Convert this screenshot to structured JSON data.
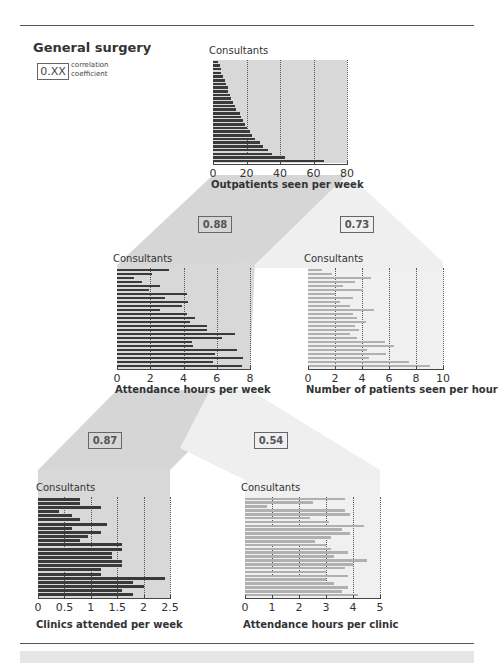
{
  "title": "General surgery",
  "legend": {
    "box_label": "0.XX",
    "text_line1": "correlation",
    "text_line2": "coefficient"
  },
  "colors": {
    "dark_bar": "#3a3a3a",
    "light_bar": "#b0b0b0",
    "dark_band": "#cfcfcf",
    "light_band": "#ececec",
    "plot_bg": "#d8d8d8",
    "plot_bg_light": "#f0f0f0"
  },
  "correlations": [
    {
      "id": "outpatients_vs_attendance",
      "value": "0.88"
    },
    {
      "id": "outpatients_vs_patients_per_hour",
      "value": "0.73"
    },
    {
      "id": "attendance_vs_clinics",
      "value": "0.87"
    },
    {
      "id": "attendance_vs_hours_per_clinic",
      "value": "0.54"
    }
  ],
  "chart_data": [
    {
      "type": "bar",
      "orientation": "horizontal",
      "title": "Consultants",
      "xlabel": "Outpatients seen per week",
      "ylabel": "Consultants",
      "xlim": [
        0,
        80
      ],
      "ticks": [
        "0",
        "20",
        "40",
        "60",
        "80"
      ],
      "grid": true,
      "values": [
        3,
        4,
        5,
        5,
        6,
        7,
        8,
        9,
        9,
        10,
        11,
        12,
        13,
        14,
        16,
        17,
        18,
        19,
        20,
        22,
        23,
        25,
        28,
        30,
        33,
        35,
        43,
        66
      ]
    },
    {
      "type": "bar",
      "orientation": "horizontal",
      "title": "Consultants",
      "xlabel": "Attendance hours per week",
      "ylabel": "Consultants",
      "xlim": [
        0,
        8
      ],
      "ticks": [
        "0",
        "2",
        "4",
        "6",
        "8"
      ],
      "grid": true,
      "values": [
        3.1,
        2.1,
        1.0,
        1.5,
        2.6,
        1.9,
        4.2,
        2.9,
        4.3,
        3.9,
        2.6,
        4.2,
        4.7,
        4.4,
        5.4,
        5.4,
        7.1,
        6.3,
        4.5,
        4.6,
        7.2,
        5.9,
        7.6,
        5.8,
        7.5
      ]
    },
    {
      "type": "bar",
      "orientation": "horizontal",
      "title": "Consultants",
      "xlabel": "Number of patients seen per hour",
      "ylabel": "Consultants",
      "xlim": [
        0,
        10
      ],
      "ticks": [
        "0",
        "2",
        "4",
        "6",
        "8",
        "10"
      ],
      "grid": true,
      "values": [
        1.0,
        1.8,
        4.7,
        3.5,
        2.6,
        4.1,
        2.0,
        3.3,
        2.4,
        3.1,
        4.9,
        3.3,
        3.6,
        4.3,
        3.5,
        3.8,
        3.1,
        3.6,
        5.7,
        6.4,
        4.4,
        5.8,
        4.5,
        7.5,
        9.0
      ]
    },
    {
      "type": "bar",
      "orientation": "horizontal",
      "title": "Consultants",
      "xlabel": "Clinics attended per week",
      "ylabel": "Consultants",
      "xlim": [
        0,
        2.5
      ],
      "ticks": [
        "0",
        "0.5",
        "1",
        "1.5",
        "2",
        "2.5"
      ],
      "grid": true,
      "values": [
        0.8,
        0.8,
        1.2,
        0.4,
        0.65,
        0.8,
        1.3,
        0.65,
        1.2,
        0.95,
        0.8,
        1.6,
        1.6,
        1.4,
        1.4,
        1.6,
        1.6,
        1.2,
        1.2,
        2.4,
        1.8,
        2.0,
        1.6,
        1.8
      ]
    },
    {
      "type": "bar",
      "orientation": "horizontal",
      "title": "Consultants",
      "xlabel": "Attendance hours per clinic",
      "ylabel": "Consultants",
      "xlim": [
        0,
        5
      ],
      "ticks": [
        "0",
        "1",
        "2",
        "3",
        "4",
        "5"
      ],
      "grid": true,
      "values": [
        3.7,
        2.5,
        0.8,
        3.7,
        3.9,
        2.4,
        3.1,
        4.4,
        3.6,
        3.9,
        3.2,
        2.6,
        3.0,
        3.2,
        3.8,
        3.3,
        4.5,
        4.0,
        3.7,
        3.0,
        3.8,
        3.0,
        3.3,
        3.8,
        3.6,
        4.2
      ]
    }
  ]
}
